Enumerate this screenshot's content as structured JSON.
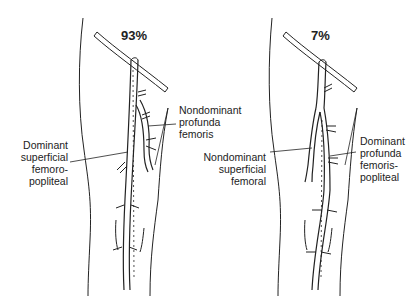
{
  "panels": [
    {
      "percentage": "93%",
      "labels": {
        "top_right": [
          "Nondominant",
          "profunda",
          "femoris"
        ],
        "left": [
          "Dominant",
          "superficial",
          "femoro-",
          "popliteal"
        ]
      }
    },
    {
      "percentage": "7%",
      "labels": {
        "left": [
          "Nondominant",
          "superficial",
          "femoral"
        ],
        "right": [
          "Dominant",
          "profunda",
          "femoris-",
          "popliteal"
        ]
      }
    }
  ]
}
